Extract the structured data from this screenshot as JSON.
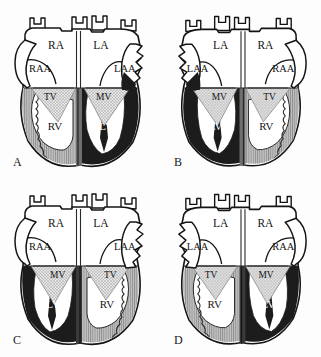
{
  "figure": {
    "background_color": "#fdfdfd",
    "ink_color": "#141414"
  },
  "legend_colors": {
    "right_ventricle_fill": "#b9b9b9",
    "left_ventricle_fill": "#1c1c1c",
    "valve_hatch_fill": "#d8d8d8",
    "chamber_fill": "#ffffff",
    "outline": "#141414"
  },
  "panels": [
    {
      "letter": "A",
      "atria": {
        "left_side": {
          "chamber": "RA",
          "appendage": "RAA"
        },
        "right_side": {
          "chamber": "LA",
          "appendage": "LAA"
        }
      },
      "ventricles": {
        "left_side": {
          "chamber": "RV",
          "valve": "TV",
          "fill": "right_ventricle_fill"
        },
        "right_side": {
          "chamber": "LV",
          "valve": "MV",
          "fill": "left_ventricle_fill"
        }
      }
    },
    {
      "letter": "B",
      "atria": {
        "left_side": {
          "chamber": "LA",
          "appendage": "LAA"
        },
        "right_side": {
          "chamber": "RA",
          "appendage": "RAA"
        }
      },
      "ventricles": {
        "left_side": {
          "chamber": "LV",
          "valve": "MV",
          "fill": "left_ventricle_fill"
        },
        "right_side": {
          "chamber": "RV",
          "valve": "TV",
          "fill": "right_ventricle_fill"
        }
      }
    },
    {
      "letter": "C",
      "atria": {
        "left_side": {
          "chamber": "RA",
          "appendage": "RAA"
        },
        "right_side": {
          "chamber": "LA",
          "appendage": "LAA"
        }
      },
      "ventricles": {
        "left_side": {
          "chamber": "LV",
          "valve": "MV",
          "fill": "left_ventricle_fill"
        },
        "right_side": {
          "chamber": "RV",
          "valve": "TV",
          "fill": "right_ventricle_fill"
        }
      }
    },
    {
      "letter": "D",
      "atria": {
        "left_side": {
          "chamber": "LA",
          "appendage": "LAA"
        },
        "right_side": {
          "chamber": "RA",
          "appendage": "RAA"
        }
      },
      "ventricles": {
        "left_side": {
          "chamber": "RV",
          "valve": "TV",
          "fill": "right_ventricle_fill"
        },
        "right_side": {
          "chamber": "LV",
          "valve": "MV",
          "fill": "left_ventricle_fill"
        }
      }
    }
  ]
}
